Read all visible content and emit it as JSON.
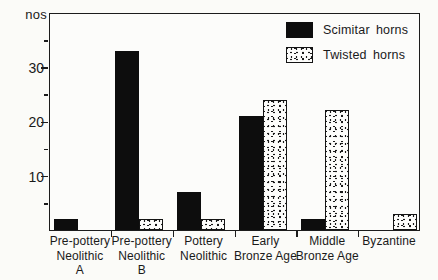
{
  "meta": {
    "background_color": "#fbfbf8",
    "ink_color": "#1a1a1a",
    "bar_solid_color": "#0d0d0d"
  },
  "chart_data": {
    "type": "bar",
    "title": "Goat horn cores",
    "y_axis_label": "nos",
    "xlabel": "",
    "ylabel": "nos",
    "ylim": [
      0,
      40
    ],
    "y_ticks_major": [
      30,
      20,
      10
    ],
    "y_ticks_minor": [
      35,
      25,
      15,
      5
    ],
    "grid": "off",
    "legend_position": "top-right-inside",
    "categories": [
      {
        "lines": [
          "Pre-pottery",
          "Neolithic",
          "A"
        ]
      },
      {
        "lines": [
          "Pre-pottery",
          "Neolithic",
          "B"
        ]
      },
      {
        "lines": [
          "Pottery",
          "Neolithic"
        ]
      },
      {
        "lines": [
          "Early",
          "Bronze Age"
        ]
      },
      {
        "lines": [
          "Middle",
          "Bronze Age"
        ]
      },
      {
        "lines": [
          "Byzantine"
        ]
      }
    ],
    "series": [
      {
        "name": "Scimitar horns",
        "style": "solid",
        "values": [
          2,
          33,
          7,
          21,
          2,
          0
        ]
      },
      {
        "name": "Twisted horns",
        "style": "stipple",
        "values": [
          0,
          2,
          2,
          24,
          22,
          3
        ]
      }
    ]
  }
}
